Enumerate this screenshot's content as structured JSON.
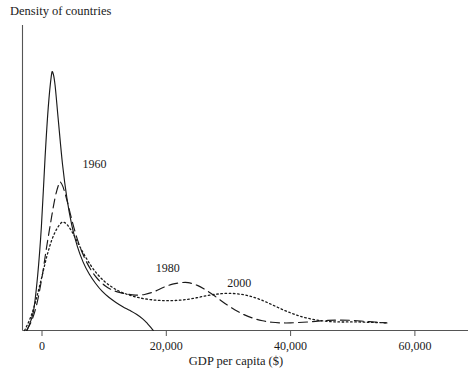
{
  "chart_data": {
    "type": "line",
    "title": "",
    "ylabel": "Density of countries",
    "xlabel": "GDP per capita ($)",
    "xlim": [
      -3000,
      70000
    ],
    "ylim": [
      0,
      1
    ],
    "grid": false,
    "legend_position": "inline-annotations",
    "x_ticks": [
      0,
      20000,
      40000,
      60000
    ],
    "x_tick_labels": [
      "0",
      "20,000",
      "40,000",
      "60,000"
    ],
    "y_ticks": [],
    "y_tick_labels": [],
    "axis_color": "#555555",
    "line_color": "#1a1a1a",
    "annotations": [
      {
        "text": "1960",
        "x": 6500,
        "y": 0.545
      },
      {
        "text": "1980",
        "x": 18300,
        "y": 0.205
      },
      {
        "text": "2000",
        "x": 29800,
        "y": 0.155
      }
    ],
    "series": [
      {
        "name": "1960",
        "style": "solid",
        "peak_x": 1700,
        "peak_y": 0.845,
        "points": [
          [
            -2400,
            0.0
          ],
          [
            -1400,
            0.06
          ],
          [
            -700,
            0.18
          ],
          [
            -100,
            0.34
          ],
          [
            500,
            0.57
          ],
          [
            1000,
            0.73
          ],
          [
            1500,
            0.835
          ],
          [
            1750,
            0.845
          ],
          [
            2100,
            0.805
          ],
          [
            2600,
            0.695
          ],
          [
            3300,
            0.545
          ],
          [
            4000,
            0.435
          ],
          [
            4800,
            0.345
          ],
          [
            5700,
            0.275
          ],
          [
            6600,
            0.225
          ],
          [
            7600,
            0.185
          ],
          [
            8600,
            0.155
          ],
          [
            9700,
            0.128
          ],
          [
            10800,
            0.108
          ],
          [
            11900,
            0.092
          ],
          [
            13000,
            0.078
          ],
          [
            14100,
            0.066
          ],
          [
            15200,
            0.053
          ],
          [
            16200,
            0.038
          ],
          [
            17000,
            0.022
          ],
          [
            17600,
            0.008
          ],
          [
            17900,
            0.0
          ]
        ]
      },
      {
        "name": "1980",
        "style": "dashed",
        "peak_x": 2900,
        "peak_y": 0.487,
        "points": [
          [
            -2500,
            0.0
          ],
          [
            -1600,
            0.035
          ],
          [
            -800,
            0.09
          ],
          [
            0,
            0.175
          ],
          [
            700,
            0.268
          ],
          [
            1400,
            0.355
          ],
          [
            2100,
            0.435
          ],
          [
            2700,
            0.48
          ],
          [
            2950,
            0.487
          ],
          [
            3400,
            0.47
          ],
          [
            4100,
            0.42
          ],
          [
            4900,
            0.355
          ],
          [
            5800,
            0.292
          ],
          [
            6800,
            0.24
          ],
          [
            7900,
            0.198
          ],
          [
            9000,
            0.168
          ],
          [
            10200,
            0.146
          ],
          [
            11400,
            0.132
          ],
          [
            12600,
            0.124
          ],
          [
            13800,
            0.119
          ],
          [
            15000,
            0.116
          ],
          [
            16500,
            0.118
          ],
          [
            18000,
            0.127
          ],
          [
            19500,
            0.141
          ],
          [
            21000,
            0.152
          ],
          [
            22500,
            0.157
          ],
          [
            23500,
            0.157
          ],
          [
            25000,
            0.148
          ],
          [
            26500,
            0.131
          ],
          [
            28000,
            0.11
          ],
          [
            29500,
            0.088
          ],
          [
            31000,
            0.068
          ],
          [
            32500,
            0.052
          ],
          [
            34000,
            0.04
          ],
          [
            35500,
            0.032
          ],
          [
            37000,
            0.027
          ],
          [
            38500,
            0.025
          ],
          [
            40000,
            0.025
          ],
          [
            42000,
            0.027
          ],
          [
            44000,
            0.03
          ],
          [
            46000,
            0.033
          ],
          [
            48000,
            0.034
          ],
          [
            50000,
            0.033
          ],
          [
            52000,
            0.03
          ],
          [
            54000,
            0.027
          ],
          [
            55500,
            0.025
          ]
        ]
      },
      {
        "name": "2000",
        "style": "dotted",
        "peak_x": 3400,
        "peak_y": 0.355,
        "points": [
          [
            -2800,
            0.0
          ],
          [
            -1800,
            0.045
          ],
          [
            -900,
            0.105
          ],
          [
            0,
            0.178
          ],
          [
            800,
            0.245
          ],
          [
            1600,
            0.298
          ],
          [
            2400,
            0.334
          ],
          [
            3100,
            0.353
          ],
          [
            3450,
            0.355
          ],
          [
            4000,
            0.348
          ],
          [
            4800,
            0.325
          ],
          [
            5700,
            0.29
          ],
          [
            6700,
            0.252
          ],
          [
            7800,
            0.215
          ],
          [
            8900,
            0.185
          ],
          [
            10100,
            0.16
          ],
          [
            11300,
            0.142
          ],
          [
            12500,
            0.128
          ],
          [
            13800,
            0.118
          ],
          [
            15100,
            0.11
          ],
          [
            16500,
            0.104
          ],
          [
            18000,
            0.1
          ],
          [
            19500,
            0.098
          ],
          [
            21000,
            0.098
          ],
          [
            22500,
            0.1
          ],
          [
            24000,
            0.104
          ],
          [
            25500,
            0.11
          ],
          [
            27000,
            0.116
          ],
          [
            28500,
            0.12
          ],
          [
            30000,
            0.122
          ],
          [
            31500,
            0.12
          ],
          [
            33000,
            0.115
          ],
          [
            34500,
            0.106
          ],
          [
            36000,
            0.094
          ],
          [
            37500,
            0.08
          ],
          [
            39000,
            0.066
          ],
          [
            40500,
            0.054
          ],
          [
            42000,
            0.044
          ],
          [
            43500,
            0.037
          ],
          [
            45000,
            0.032
          ],
          [
            46500,
            0.029
          ],
          [
            48000,
            0.028
          ],
          [
            49500,
            0.028
          ],
          [
            51000,
            0.028
          ],
          [
            52500,
            0.027
          ],
          [
            54000,
            0.026
          ],
          [
            55500,
            0.025
          ]
        ]
      }
    ]
  }
}
